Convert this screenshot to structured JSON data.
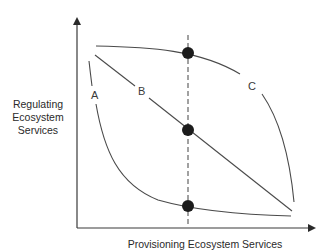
{
  "diagram": {
    "type": "trade-off diagram",
    "y_axis_label_lines": [
      "Regulating",
      "Ecosystem",
      "Services"
    ],
    "x_axis_label": "Provisioning Ecosystem Services",
    "curves": [
      {
        "id": "A",
        "label": "A",
        "shape": "convex (bowed toward origin)"
      },
      {
        "id": "B",
        "label": "B",
        "shape": "linear"
      },
      {
        "id": "C",
        "label": "C",
        "shape": "concave (bowed away from origin)"
      }
    ],
    "reference_line": {
      "style": "dashed vertical",
      "intersects": [
        "C",
        "B",
        "A"
      ]
    },
    "points": [
      {
        "on_curve": "C",
        "position": "top"
      },
      {
        "on_curve": "B",
        "position": "middle"
      },
      {
        "on_curve": "A",
        "position": "bottom"
      }
    ]
  },
  "colors": {
    "background": "#ffffff",
    "lines": "#4a4a4a",
    "dots": "#1c1c1c",
    "text": "#2a2a2a"
  }
}
